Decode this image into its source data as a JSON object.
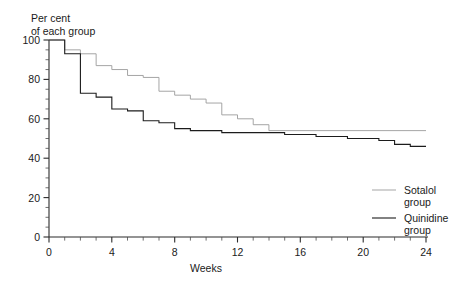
{
  "chart_data": {
    "type": "line",
    "subtype": "step",
    "title": "Per cent of each group",
    "title_lines": [
      "Per cent",
      "of each group"
    ],
    "xlabel": "Weeks",
    "ylabel": "",
    "xlim": [
      0,
      24
    ],
    "ylim": [
      0,
      100
    ],
    "grid": false,
    "legend_position": "right",
    "x_ticks_major": [
      0,
      4,
      8,
      12,
      16,
      20,
      24
    ],
    "x_ticks_major_labels": [
      "0",
      "4",
      "8",
      "12",
      "16",
      "20",
      "24"
    ],
    "x_tick_minor_step": 1,
    "y_ticks_major": [
      0,
      20,
      40,
      60,
      80,
      100
    ],
    "y_ticks_major_labels": [
      "0",
      "20",
      "40",
      "60",
      "80",
      "100"
    ],
    "y_tick_minor_step": 5,
    "series": [
      {
        "name": "Sotalol group",
        "color": "#9b9b9b",
        "legend_label_lines": [
          "Sotalol",
          "group"
        ],
        "x": [
          0,
          1,
          1,
          2,
          2,
          3,
          3,
          4,
          4,
          5,
          5,
          6,
          6,
          7,
          7,
          8,
          8,
          9,
          9,
          10,
          10,
          11,
          11,
          12,
          12,
          13,
          13,
          14,
          14,
          24
        ],
        "y": [
          100,
          100,
          95,
          95,
          93,
          93,
          87,
          87,
          85,
          85,
          82,
          82,
          81,
          81,
          74,
          74,
          72,
          72,
          70,
          70,
          68,
          68,
          62,
          62,
          60,
          60,
          57,
          57,
          54,
          54
        ],
        "values_at_weeks": {
          "0": 100,
          "1": 95,
          "2": 93,
          "3": 87,
          "4": 85,
          "5": 82,
          "6": 81,
          "7": 74,
          "8": 72,
          "9": 70,
          "10": 68,
          "11": 62,
          "12": 60,
          "13": 57,
          "14": 54,
          "24": 54
        },
        "final_value": 54
      },
      {
        "name": "Quinidine group",
        "color": "#1c1c1c",
        "legend_label_lines": [
          "Quinidine",
          "group"
        ],
        "x": [
          0,
          1,
          1,
          2,
          2,
          3,
          3,
          4,
          4,
          5,
          5,
          6,
          6,
          7,
          7,
          8,
          8,
          9,
          9,
          11,
          11,
          13,
          13,
          15,
          15,
          17,
          17,
          19,
          19,
          21,
          21,
          22,
          22,
          23,
          23,
          24
        ],
        "y": [
          100,
          100,
          93,
          93,
          73,
          73,
          71,
          71,
          65,
          65,
          64,
          64,
          59,
          59,
          58,
          58,
          55,
          55,
          54,
          54,
          53,
          53,
          53,
          53,
          52,
          52,
          51,
          51,
          50,
          50,
          49,
          49,
          47,
          47,
          46,
          46
        ],
        "values_at_weeks": {
          "0": 100,
          "1": 93,
          "2": 73,
          "3": 71,
          "4": 65,
          "5": 64,
          "6": 59,
          "7": 58,
          "8": 55,
          "9": 54,
          "11": 53,
          "13": 53,
          "15": 52,
          "17": 51,
          "19": 50,
          "21": 49,
          "22": 47,
          "23": 46,
          "24": 46
        },
        "final_value": 46
      }
    ]
  }
}
